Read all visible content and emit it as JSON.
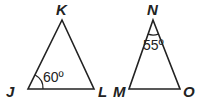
{
  "diagram": {
    "stroke_color": "#222222",
    "triangles": [
      {
        "name": "JKL",
        "vertices": {
          "K": {
            "label": "K",
            "x": 62,
            "y": 9
          },
          "J": {
            "label": "J",
            "x": 18,
            "y": 90
          },
          "L": {
            "label": "L",
            "x": 103,
            "y": 90
          }
        },
        "angle_mark": {
          "vertex": "J",
          "label": "60º"
        }
      },
      {
        "name": "MNO",
        "vertices": {
          "N": {
            "label": "N",
            "x": 153,
            "y": 9
          },
          "M": {
            "label": "M",
            "x": 124,
            "y": 90
          },
          "O": {
            "label": "O",
            "x": 182,
            "y": 90
          }
        },
        "angle_mark": {
          "vertex": "N",
          "label": "55º"
        }
      }
    ]
  }
}
